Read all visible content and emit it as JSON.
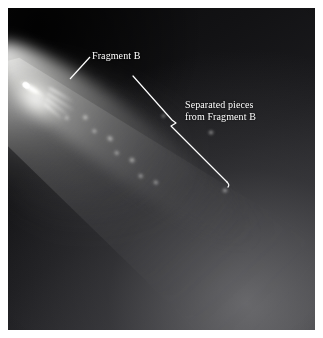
{
  "figure": {
    "type": "astronomical-photograph",
    "border_color": "#ffffff",
    "background_color": "#0b0b0c"
  },
  "annotations": [
    {
      "id": "fragment-b",
      "text": "Fragment B",
      "lines": [
        "Fragment B"
      ],
      "color": "#ffffff",
      "leader": {
        "from_x": 70,
        "from_y": 79,
        "to_x": 90,
        "to_y": 57
      }
    },
    {
      "id": "separated-pieces",
      "text": "Separated pieces from Fragment B",
      "lines": [
        "Separated pieces",
        "from Fragment B"
      ],
      "color": "#ffffff",
      "leader": {
        "from_x": 133,
        "from_y": 76,
        "notch_x": 176,
        "notch_y": 123,
        "to_x": 227,
        "to_y": 184
      }
    }
  ],
  "features": {
    "nucleus_label": "bright nucleus streak",
    "tail_label": "dust tail",
    "knots_label": "separated fragment knots"
  }
}
